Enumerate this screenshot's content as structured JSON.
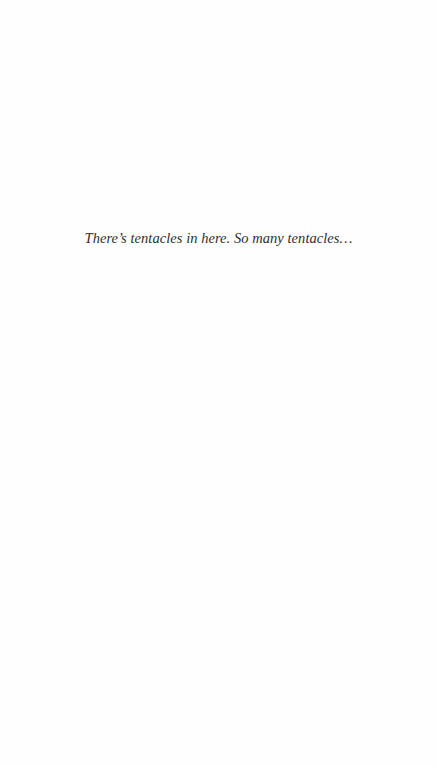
{
  "page": {
    "background": "#fefefe",
    "epigraph": {
      "text": "There’s tentacles in here. So many tentacles…",
      "color": "#2f2f2f"
    }
  }
}
